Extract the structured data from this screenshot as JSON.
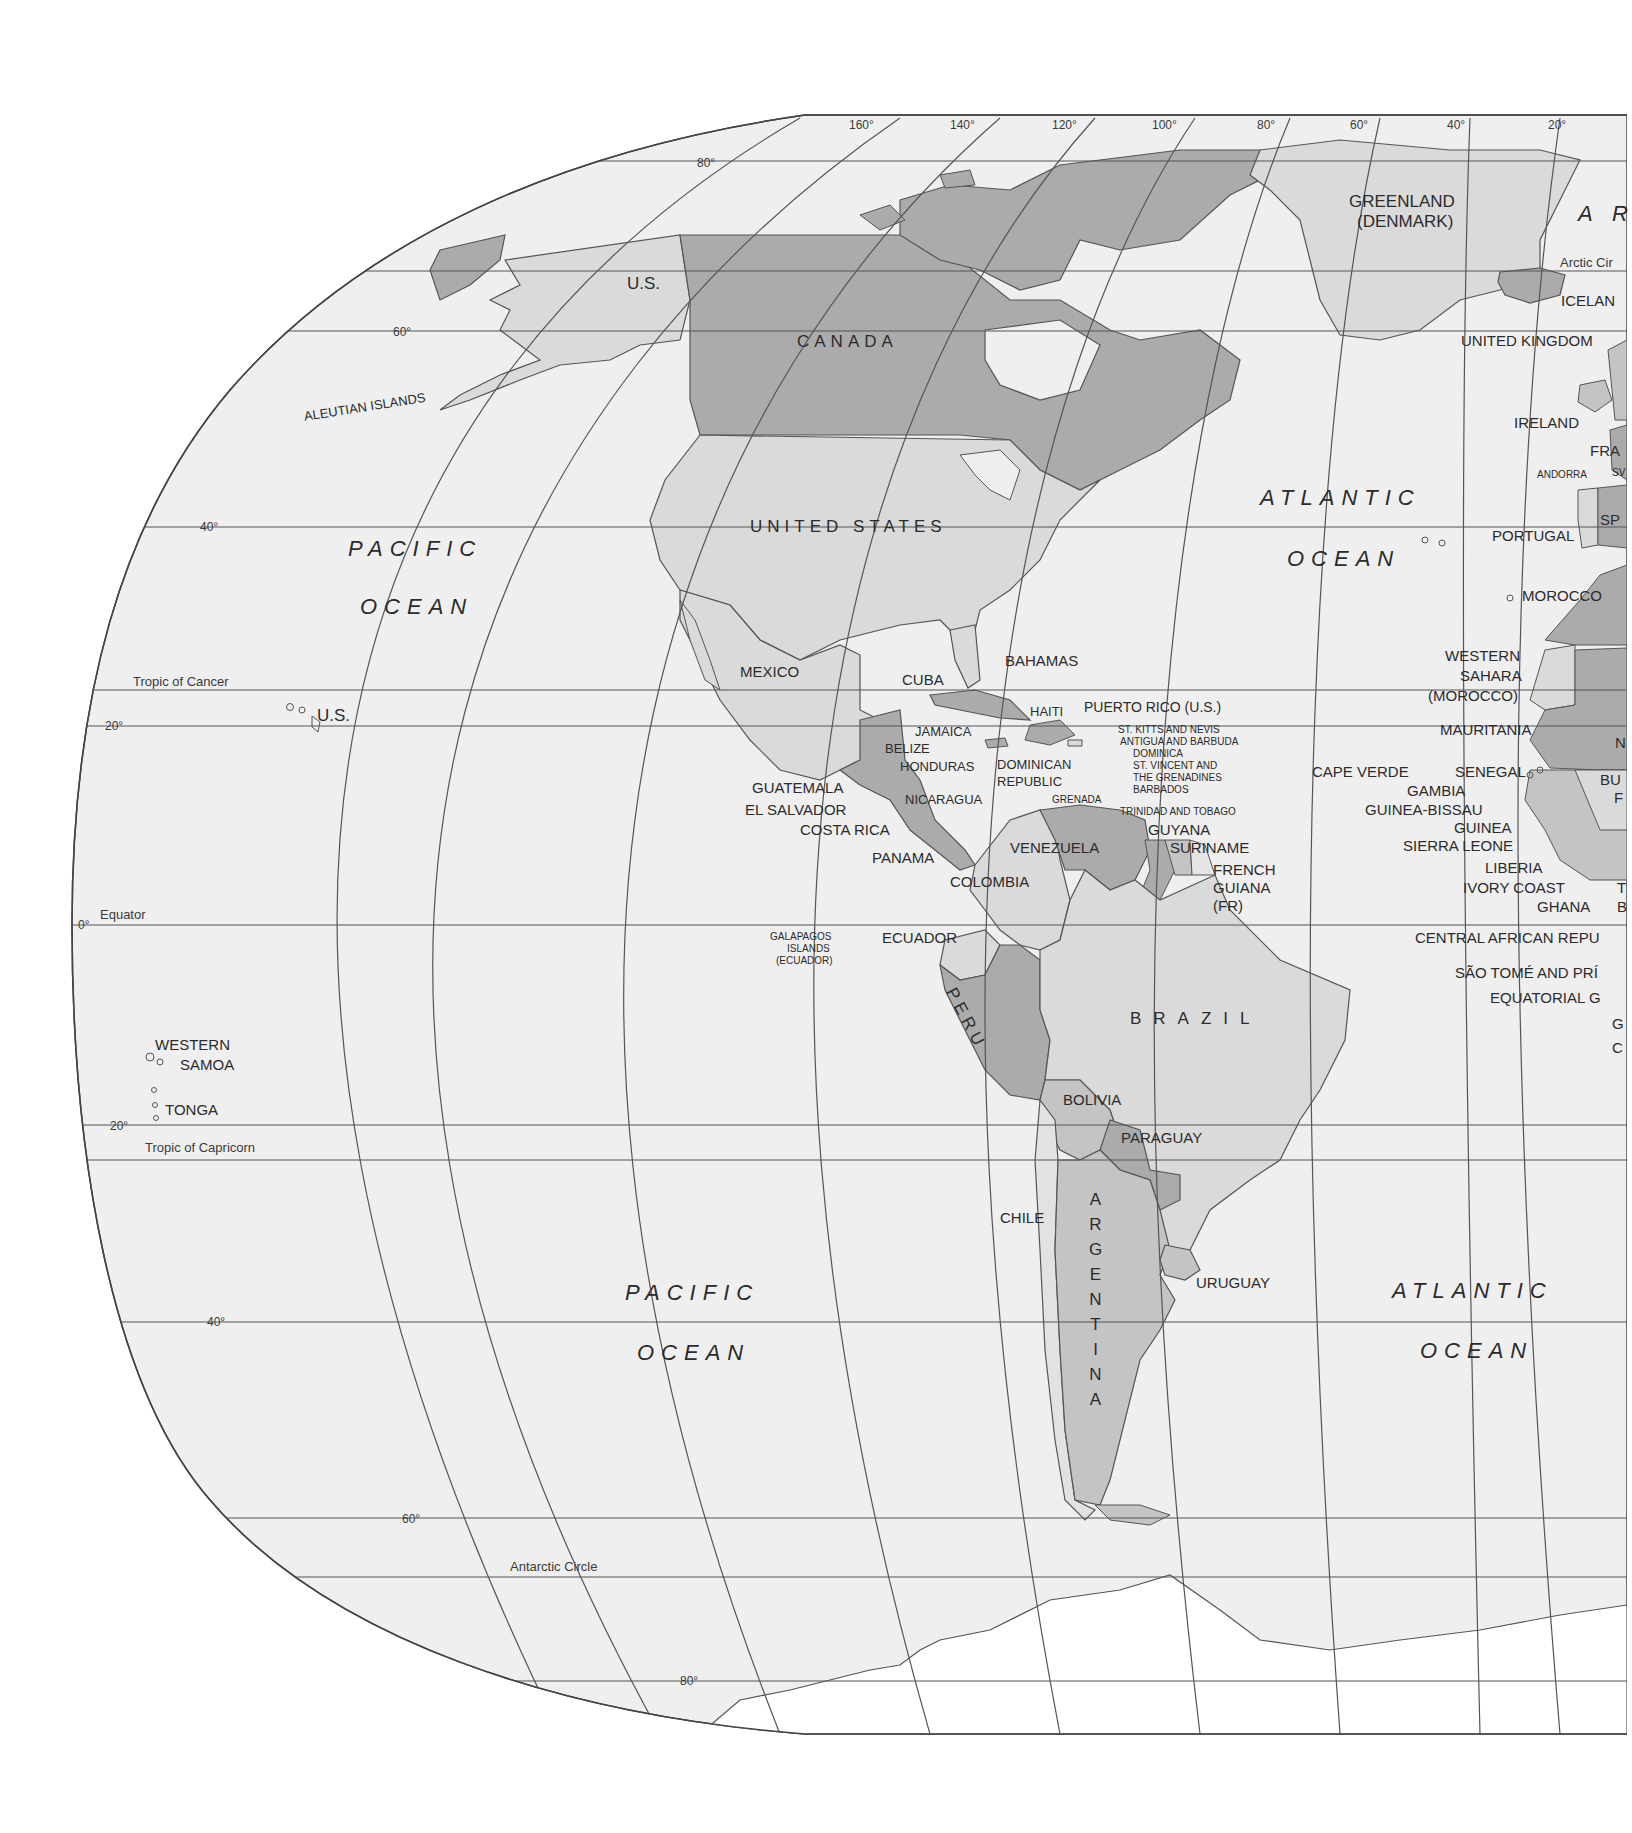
{
  "map": {
    "title": "World map – Western Hemisphere (Americas)",
    "colors": {
      "background": "#ffffff",
      "ocean": "#efefef",
      "land_light": "#dadada",
      "land_dark": "#ababab",
      "land_mid": "#c4c4c4",
      "line": "#555555",
      "text": "#2b2b2b"
    },
    "longitude_labels": [
      "160°",
      "140°",
      "120°",
      "100°",
      "80°",
      "60°",
      "40°",
      "20°"
    ],
    "latitude_labels": {
      "n80": "80°",
      "n60": "60°",
      "n40": "40°",
      "n20": "20°",
      "eq": "0°",
      "s20": "20°",
      "s40": "40°",
      "s60": "60°",
      "s80": "80°"
    },
    "special_lines": {
      "arctic_circle": "Arctic Cir",
      "tropic_cancer": "Tropic of Cancer",
      "equator": "Equator",
      "tropic_capricorn": "Tropic of Capricorn",
      "antarctic_circle": "Antarctic Circle"
    },
    "oceans": {
      "pacific_north_1": "PACIFIC",
      "pacific_north_2": "OCEAN",
      "pacific_south_1": "PACIFIC",
      "pacific_south_2": "OCEAN",
      "atlantic_north_1": "ATLANTIC",
      "atlantic_north_2": "OCEAN",
      "atlantic_south_1": "ATLANTIC",
      "atlantic_south_2": "OCEAN",
      "arctic_partial": "A R"
    },
    "north_america": {
      "us_alaska": "U.S.",
      "canada": "CANADA",
      "united_states": "UNITED STATES",
      "greenland_1": "GREENLAND",
      "greenland_2": "(DENMARK)",
      "aleutian": "ALEUTIAN ISLANDS",
      "hawaii_us": "U.S.",
      "mexico": "MEXICO",
      "cuba": "CUBA",
      "bahamas": "BAHAMAS",
      "haiti": "HAITI",
      "puerto_rico": "PUERTO RICO (U.S.)",
      "jamaica": "JAMAICA",
      "belize": "BELIZE",
      "honduras": "HONDURAS",
      "dominican_1": "DOMINICAN",
      "dominican_2": "REPUBLIC",
      "guatemala": "GUATEMALA",
      "el_salvador": "EL SALVADOR",
      "nicaragua": "NICARAGUA",
      "costa_rica": "COSTA RICA",
      "panama": "PANAMA",
      "grenada": "GRENADA",
      "st_kitts": "ST. KITTS AND NEVIS",
      "antigua": "ANTIGUA AND BARBUDA",
      "dominica": "DOMINICA",
      "st_vincent_1": "ST. VINCENT AND",
      "st_vincent_2": "THE GRENADINES",
      "barbados": "BARBADOS",
      "trinidad": "TRINIDAD AND TOBAGO"
    },
    "south_america": {
      "venezuela": "VENEZUELA",
      "guyana": "GUYANA",
      "suriname": "SURINAME",
      "french_guiana_1": "FRENCH",
      "french_guiana_2": "GUIANA",
      "french_guiana_3": "(FR)",
      "colombia": "COLOMBIA",
      "ecuador": "ECUADOR",
      "galapagos_1": "GALAPAGOS",
      "galapagos_2": "ISLANDS",
      "galapagos_3": "(ECUADOR)",
      "peru": "PERU",
      "brazil": "BRAZIL",
      "bolivia": "BOLIVIA",
      "paraguay": "PARAGUAY",
      "chile": "CHILE",
      "argentina": "ARGENTINA",
      "uruguay": "URUGUAY"
    },
    "pacific_islands": {
      "western_samoa_1": "WESTERN",
      "western_samoa_2": "SAMOA",
      "tonga": "TONGA"
    },
    "europe_africa": {
      "iceland": "ICELAN",
      "united_kingdom": "UNITED KINGDOM",
      "ireland": "IRELAND",
      "france": "FRA",
      "andorra": "ANDORRA",
      "sw": "SV",
      "spain": "SP",
      "portugal": "PORTUGAL",
      "morocco": "MOROCCO",
      "western_sahara_1": "WESTERN",
      "western_sahara_2": "SAHARA",
      "western_sahara_3": "(MOROCCO)",
      "mauritania": "MAURITANIA",
      "cape_verde": "CAPE VERDE",
      "senegal": "SENEGAL",
      "gambia": "GAMBIA",
      "guinea_bissau": "GUINEA-BISSAU",
      "guinea": "GUINEA",
      "sierra_leone": "SIERRA LEONE",
      "liberia": "LIBERIA",
      "ivory_coast": "IVORY COAST",
      "ghana": "GHANA",
      "togo": "T",
      "benin": "B",
      "burkina": "BU",
      "burkina_2": "F",
      "niger": "N",
      "central_african": "CENTRAL AFRICAN REPU",
      "sao_tome": "SÃO TOMÉ AND PRÍ",
      "equatorial_guinea": "EQUATORIAL G",
      "gabon": "G",
      "congo": "C"
    }
  }
}
